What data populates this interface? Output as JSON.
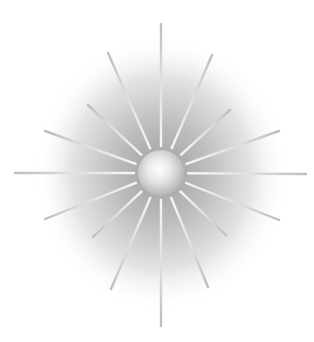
{
  "image": {
    "subject": "starburst-illustration",
    "background_color": "#ffffff",
    "center": {
      "x": 161,
      "y": 173
    },
    "halo": {
      "rx": 128,
      "ry": 138,
      "inner_color": "#a9a9a9",
      "outer_color": "#ffffff"
    },
    "orb": {
      "r": 23,
      "highlight_color": "#ffffff",
      "edge_color": "#b4b4b4"
    },
    "ray_color_inner": "#f6f6f6",
    "ray_color_outer": "#bdbdbd",
    "rays": [
      {
        "x": 161,
        "y": 24
      },
      {
        "x": 212,
        "y": 55
      },
      {
        "x": 230,
        "y": 110
      },
      {
        "x": 279,
        "y": 131
      },
      {
        "x": 306,
        "y": 174
      },
      {
        "x": 279,
        "y": 220
      },
      {
        "x": 226,
        "y": 235
      },
      {
        "x": 208,
        "y": 287
      },
      {
        "x": 161,
        "y": 326
      },
      {
        "x": 111,
        "y": 289
      },
      {
        "x": 93,
        "y": 237
      },
      {
        "x": 45,
        "y": 219
      },
      {
        "x": 15,
        "y": 173
      },
      {
        "x": 45,
        "y": 131
      },
      {
        "x": 88,
        "y": 105
      },
      {
        "x": 108,
        "y": 53
      }
    ]
  }
}
